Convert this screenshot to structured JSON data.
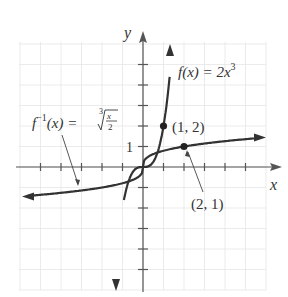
{
  "chart_data": {
    "type": "line",
    "title": "",
    "xlabel": "x",
    "ylabel": "y",
    "xlim": [
      -6,
      6
    ],
    "ylim": [
      -6,
      6
    ],
    "grid": true,
    "tick_labels": {
      "y_one": "1"
    },
    "series": [
      {
        "name": "f(x) = 2x^3",
        "label_main": "f(x) = 2x",
        "label_exp": "3",
        "x": [
          -0.95,
          -0.8,
          -0.6,
          -0.4,
          -0.2,
          0,
          0.2,
          0.4,
          0.6,
          0.8,
          1.0,
          1.2,
          1.3
        ],
        "y": [
          -6,
          -4.1,
          -0.43,
          -0.128,
          -0.016,
          0,
          0.016,
          0.128,
          0.43,
          1.02,
          2,
          3.46,
          4.39
        ]
      },
      {
        "name": "f^-1(x) = cbrt(x/2)",
        "label_f": "f",
        "label_inv": "−1",
        "label_rest": "(x) = ",
        "label_root_index": "3",
        "label_num": "x",
        "label_den": "2",
        "x": [
          -6,
          -4,
          -2,
          -1,
          -0.5,
          0,
          0.5,
          1,
          2,
          4,
          6
        ],
        "y": [
          -1.44,
          -1.26,
          -1.0,
          -0.79,
          -0.63,
          0,
          0.63,
          0.79,
          1.0,
          1.26,
          1.44
        ]
      }
    ],
    "points": [
      {
        "x": 1,
        "y": 2,
        "label": "(1, 2)"
      },
      {
        "x": 2,
        "y": 1,
        "label": "(2, 1)"
      }
    ]
  }
}
